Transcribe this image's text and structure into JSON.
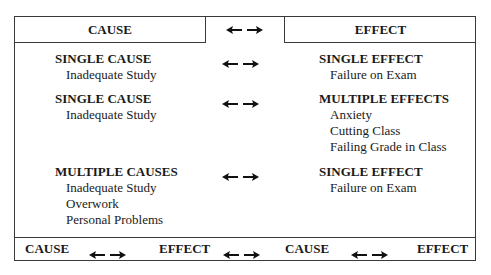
{
  "header": {
    "cause_label": "CAUSE",
    "effect_label": "EFFECT",
    "connector_icon": "double-arrow-icon"
  },
  "rows": [
    {
      "cause_title": "SINGLE CAUSE",
      "cause_items": [
        "Inadequate Study"
      ],
      "effect_title": "SINGLE EFFECT",
      "effect_items": [
        "Failure on Exam"
      ]
    },
    {
      "cause_title": "SINGLE CAUSE",
      "cause_items": [
        "Inadequate Study"
      ],
      "effect_title": "MULTIPLE EFFECTS",
      "effect_items": [
        "Anxiety",
        "Cutting Class",
        "Failing Grade in Class"
      ]
    },
    {
      "cause_title": "MULTIPLE CAUSES",
      "cause_items": [
        "Inadequate Study",
        "Overwork",
        "Personal Problems"
      ],
      "effect_title": "SINGLE EFFECT",
      "effect_items": [
        "Failure on Exam"
      ]
    }
  ],
  "footer": {
    "chain": [
      "CAUSE",
      "EFFECT",
      "CAUSE",
      "EFFECT"
    ]
  }
}
